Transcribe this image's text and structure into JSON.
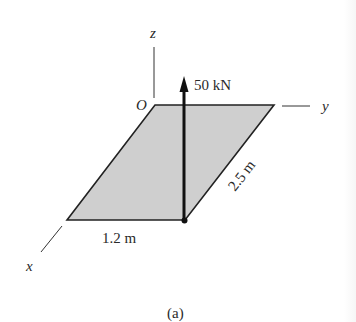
{
  "figure": {
    "caption": "(a)",
    "axes": {
      "x_label": "x",
      "y_label": "y",
      "z_label": "z",
      "origin_label": "O"
    },
    "force": {
      "label": "50 kN",
      "direction": "+z",
      "application_point": "corner of plate opposite O along x and y"
    },
    "plate": {
      "shape": "rectangular plate in x-y plane",
      "fill_color": "#cfcfcf",
      "edge_color": "#222222",
      "dimension_x_label": "1.2 m",
      "dimension_y_label": "2.5 m"
    },
    "colors": {
      "line": "#222222",
      "text": "#2a2a2a",
      "background": "#ffffff"
    }
  }
}
